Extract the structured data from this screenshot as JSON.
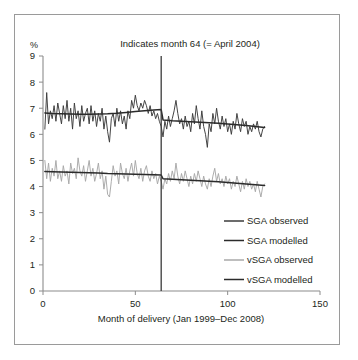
{
  "figure": {
    "title": "Indicates month 64 (= April 2004)",
    "y_unit_label": "%",
    "x_axis_title": "Month of delivery (Jan 1999–Dec 2008)"
  },
  "legend": {
    "items": [
      {
        "label": "SGA observed",
        "color": "#3b3b3b"
      },
      {
        "label": "SGA modelled",
        "color": "#2b2b2b"
      },
      {
        "label": "vSGA observed",
        "color": "#a8a8a8"
      },
      {
        "label": "vSGA modelled",
        "color": "#2b2b2b"
      }
    ]
  },
  "chart_data": {
    "type": "line",
    "title": "Indicates month 64 (= April 2004)",
    "xlabel": "Month of delivery (Jan 1999–Dec 2008)",
    "ylabel": "%",
    "xlim": [
      0,
      150
    ],
    "ylim": [
      0,
      9
    ],
    "xticks": [
      0,
      50,
      100,
      150
    ],
    "yticks": [
      0,
      1,
      2,
      3,
      4,
      5,
      6,
      7,
      8,
      9
    ],
    "grid": false,
    "legend_position": "inside-lower-right",
    "annotations": [
      {
        "type": "vline",
        "x": 64,
        "label": "Indicates month 64 (= April 2004)",
        "color": "#3a3a3a"
      }
    ],
    "series": [
      {
        "name": "SGA observed",
        "color": "#3b3b3b",
        "x": [
          1,
          2,
          3,
          4,
          5,
          6,
          7,
          8,
          9,
          10,
          11,
          12,
          13,
          14,
          15,
          16,
          17,
          18,
          19,
          20,
          21,
          22,
          23,
          24,
          25,
          26,
          27,
          28,
          29,
          30,
          31,
          32,
          33,
          34,
          35,
          36,
          37,
          38,
          39,
          40,
          41,
          42,
          43,
          44,
          45,
          46,
          47,
          48,
          49,
          50,
          51,
          52,
          53,
          54,
          55,
          56,
          57,
          58,
          59,
          60,
          61,
          62,
          63,
          64,
          65,
          66,
          67,
          68,
          69,
          70,
          71,
          72,
          73,
          74,
          75,
          76,
          77,
          78,
          79,
          80,
          81,
          82,
          83,
          84,
          85,
          86,
          87,
          88,
          89,
          90,
          91,
          92,
          93,
          94,
          95,
          96,
          97,
          98,
          99,
          100,
          101,
          102,
          103,
          104,
          105,
          106,
          107,
          108,
          109,
          110,
          111,
          112,
          113,
          114,
          115,
          116,
          117,
          118,
          119,
          120
        ],
        "values": [
          6.2,
          7.6,
          6.4,
          6.9,
          6.6,
          7.1,
          6.5,
          7.2,
          6.8,
          6.4,
          7.1,
          6.6,
          7.3,
          6.5,
          7.0,
          6.2,
          7.2,
          6.6,
          6.9,
          6.3,
          7.1,
          6.5,
          6.8,
          7.0,
          6.4,
          7.1,
          6.5,
          6.9,
          6.3,
          6.8,
          6.5,
          7.0,
          6.2,
          6.7,
          6.1,
          5.7,
          6.6,
          6.8,
          6.3,
          7.0,
          6.5,
          6.9,
          6.4,
          6.7,
          6.2,
          6.9,
          6.6,
          7.3,
          7.0,
          7.5,
          7.1,
          6.9,
          7.2,
          7.0,
          7.3,
          7.1,
          6.8,
          7.1,
          6.7,
          6.9,
          6.6,
          6.8,
          6.5,
          6.3,
          5.9,
          6.5,
          6.2,
          6.7,
          6.3,
          6.6,
          6.9,
          7.3,
          6.8,
          6.4,
          6.6,
          6.2,
          6.7,
          6.3,
          6.5,
          6.1,
          6.8,
          6.4,
          7.1,
          6.6,
          6.2,
          6.9,
          6.3,
          6.0,
          5.5,
          6.4,
          6.1,
          6.8,
          6.4,
          7.0,
          6.5,
          6.2,
          6.7,
          6.3,
          6.6,
          6.1,
          6.4,
          6.0,
          6.5,
          6.2,
          6.8,
          6.4,
          6.1,
          6.6,
          6.3,
          6.5,
          6.0,
          6.3,
          6.1,
          6.4,
          6.2,
          6.5,
          6.1,
          5.9,
          6.2,
          6.3
        ]
      },
      {
        "name": "SGA modelled",
        "color": "#2b2b2b",
        "x": [
          1,
          5,
          10,
          15,
          20,
          25,
          30,
          35,
          40,
          45,
          50,
          55,
          60,
          64,
          65,
          70,
          75,
          80,
          85,
          90,
          95,
          100,
          105,
          110,
          115,
          120
        ],
        "values": [
          6.82,
          6.8,
          6.79,
          6.78,
          6.77,
          6.77,
          6.78,
          6.79,
          6.81,
          6.84,
          6.87,
          6.9,
          6.93,
          6.95,
          6.55,
          6.52,
          6.5,
          6.48,
          6.46,
          6.44,
          6.42,
          6.4,
          6.37,
          6.34,
          6.3,
          6.26
        ]
      },
      {
        "name": "vSGA observed",
        "color": "#a8a8a8",
        "x": [
          1,
          2,
          3,
          4,
          5,
          6,
          7,
          8,
          9,
          10,
          11,
          12,
          13,
          14,
          15,
          16,
          17,
          18,
          19,
          20,
          21,
          22,
          23,
          24,
          25,
          26,
          27,
          28,
          29,
          30,
          31,
          32,
          33,
          34,
          35,
          36,
          37,
          38,
          39,
          40,
          41,
          42,
          43,
          44,
          45,
          46,
          47,
          48,
          49,
          50,
          51,
          52,
          53,
          54,
          55,
          56,
          57,
          58,
          59,
          60,
          61,
          62,
          63,
          64,
          65,
          66,
          67,
          68,
          69,
          70,
          71,
          72,
          73,
          74,
          75,
          76,
          77,
          78,
          79,
          80,
          81,
          82,
          83,
          84,
          85,
          86,
          87,
          88,
          89,
          90,
          91,
          92,
          93,
          94,
          95,
          96,
          97,
          98,
          99,
          100,
          101,
          102,
          103,
          104,
          105,
          106,
          107,
          108,
          109,
          110,
          111,
          112,
          113,
          114,
          115,
          116,
          117,
          118,
          119,
          120
        ],
        "values": [
          5.0,
          4.3,
          4.9,
          4.2,
          4.7,
          4.4,
          5.0,
          4.3,
          4.6,
          4.2,
          4.8,
          4.4,
          4.6,
          4.1,
          4.9,
          4.5,
          4.7,
          4.3,
          5.1,
          4.6,
          4.4,
          4.8,
          4.2,
          4.6,
          5.0,
          4.4,
          4.7,
          4.2,
          4.5,
          4.9,
          4.3,
          4.6,
          3.9,
          4.4,
          3.7,
          3.6,
          4.2,
          4.8,
          4.4,
          4.6,
          4.1,
          4.9,
          4.5,
          4.3,
          4.7,
          4.2,
          4.6,
          4.9,
          4.4,
          5.0,
          4.5,
          4.3,
          4.7,
          4.2,
          4.6,
          4.8,
          4.4,
          4.2,
          4.6,
          4.3,
          4.5,
          4.1,
          4.4,
          4.2,
          3.9,
          4.3,
          4.1,
          4.5,
          4.2,
          4.6,
          4.3,
          4.9,
          4.4,
          4.1,
          4.5,
          4.2,
          4.6,
          4.3,
          4.0,
          4.4,
          4.1,
          4.5,
          4.2,
          4.6,
          4.3,
          4.0,
          4.4,
          4.1,
          3.9,
          4.3,
          4.0,
          4.4,
          4.7,
          4.2,
          4.5,
          4.1,
          4.3,
          4.0,
          4.4,
          4.1,
          4.3,
          3.9,
          4.2,
          4.0,
          4.4,
          4.1,
          3.8,
          4.2,
          3.9,
          4.3,
          4.0,
          4.2,
          3.9,
          4.1,
          3.8,
          4.2,
          3.9,
          3.6,
          4.0,
          4.1
        ]
      },
      {
        "name": "vSGA modelled",
        "color": "#2b2b2b",
        "x": [
          1,
          5,
          10,
          15,
          20,
          25,
          30,
          35,
          40,
          45,
          50,
          55,
          60,
          64,
          65,
          70,
          75,
          80,
          85,
          90,
          95,
          100,
          105,
          110,
          115,
          120
        ],
        "values": [
          4.58,
          4.57,
          4.56,
          4.55,
          4.54,
          4.53,
          4.52,
          4.5,
          4.49,
          4.48,
          4.47,
          4.46,
          4.45,
          4.44,
          4.3,
          4.28,
          4.26,
          4.24,
          4.22,
          4.2,
          4.18,
          4.16,
          4.13,
          4.1,
          4.07,
          4.04
        ]
      }
    ]
  }
}
